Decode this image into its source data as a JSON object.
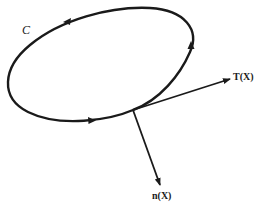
{
  "diagram": {
    "curve": {
      "label": "C",
      "type": "closed oriented curve (ellipse-like)",
      "orientation": "counterclockwise",
      "stroke_color": "#1a1a1a"
    },
    "point": {
      "name": "X",
      "position": [
        133,
        110
      ]
    },
    "vectors": [
      {
        "name": "tangent",
        "label": "T(X)",
        "from": [
          133,
          110
        ],
        "to": [
          230,
          79
        ]
      },
      {
        "name": "normal",
        "label": "n(X)",
        "from": [
          133,
          110
        ],
        "to": [
          160,
          185
        ]
      }
    ],
    "colors": {
      "ink": "#1a1a1a",
      "background": "#ffffff"
    }
  }
}
